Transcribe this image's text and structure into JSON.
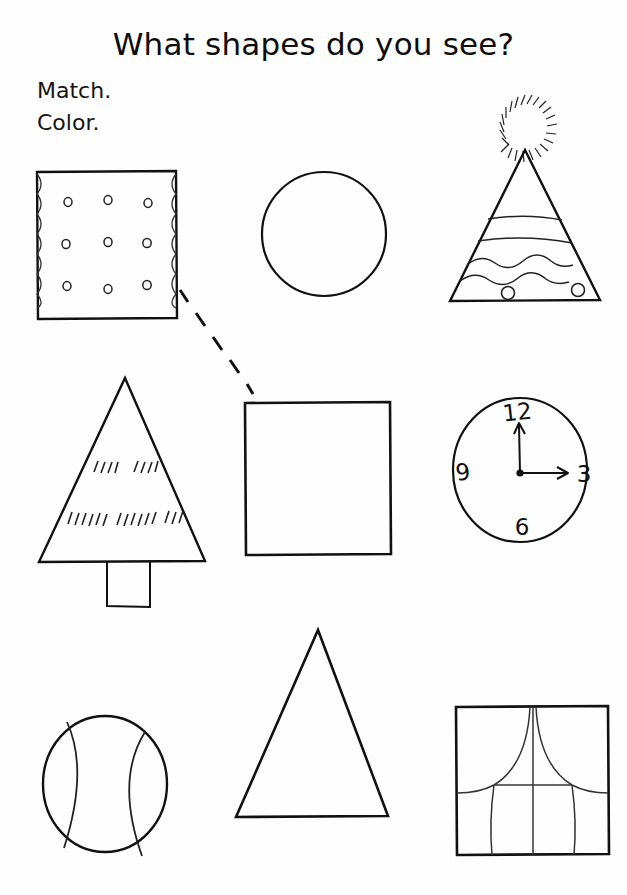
{
  "page": {
    "title": "What shapes do you see?",
    "instructions": [
      "Match.",
      "Color."
    ],
    "background_color": "#fefefe",
    "ink_color": "#111111"
  },
  "shapes": [
    {
      "id": "cracker",
      "name": "cracker",
      "shape": "square",
      "label": "Cracker",
      "row": 1,
      "column": 1,
      "matched": true,
      "details": {
        "hole_count": 9,
        "hole_grid": "3x3",
        "edges": "scalloped left and right"
      }
    },
    {
      "id": "circle",
      "name": "circle",
      "shape": "circle",
      "label": "Circle",
      "row": 1,
      "column": 2,
      "matched": false,
      "details": {
        "outline_only": true
      }
    },
    {
      "id": "party-hat",
      "name": "party-hat",
      "shape": "triangle",
      "label": "Party hat",
      "row": 1,
      "column": 3,
      "matched": false,
      "details": {
        "pom_pom": true,
        "stripe_count": 2,
        "wavy_line_count": 2,
        "dot_count": 2
      }
    },
    {
      "id": "pine-tree",
      "name": "pine-tree",
      "shape": "triangle",
      "label": "Tree",
      "row": 2,
      "column": 1,
      "matched": false,
      "details": {
        "trunk": true,
        "branch_hatch_rows": 2
      }
    },
    {
      "id": "square",
      "name": "square",
      "shape": "square",
      "label": "Square",
      "row": 2,
      "column": 2,
      "matched": true,
      "details": {
        "outline_only": true
      }
    },
    {
      "id": "clock",
      "name": "clock",
      "shape": "circle",
      "label": "Clock",
      "row": 2,
      "column": 3,
      "matched": false,
      "details": {
        "numerals": [
          "12",
          "3",
          "6",
          "9"
        ],
        "hands": [
          "minute",
          "hour"
        ],
        "time_shown": "3:00"
      }
    },
    {
      "id": "baseball",
      "name": "baseball",
      "shape": "circle",
      "label": "Baseball",
      "row": 3,
      "column": 1,
      "matched": false,
      "details": {
        "seam_count": 2
      }
    },
    {
      "id": "triangle",
      "name": "triangle",
      "shape": "triangle",
      "label": "Triangle",
      "row": 3,
      "column": 2,
      "matched": false,
      "details": {
        "outline_only": true
      }
    },
    {
      "id": "window",
      "name": "window",
      "shape": "square",
      "label": "Window",
      "row": 3,
      "column": 3,
      "details": {
        "curtains": true,
        "panes": 1
      }
    }
  ],
  "clock": {
    "numerals": {
      "twelve": "12",
      "three": "3",
      "six": "6",
      "nine": "9"
    }
  },
  "connections": [
    {
      "id": "cracker-to-square",
      "from": "cracker",
      "to": "square",
      "style": "dashed",
      "drawn_by_student": true
    }
  ]
}
